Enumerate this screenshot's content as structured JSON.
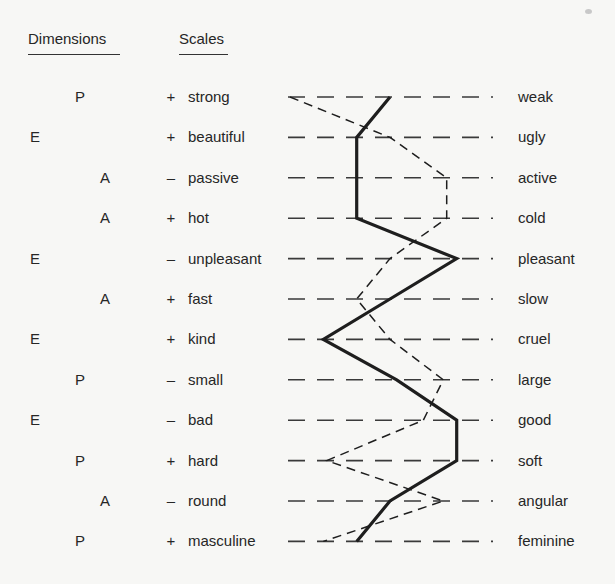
{
  "headers": {
    "dimensions": "Dimensions",
    "scales": "Scales"
  },
  "chart_data": {
    "type": "line",
    "title": "",
    "scale_points": 7,
    "xlim": [
      1,
      7
    ],
    "grid": "dashed horizontal line per scale",
    "rows": [
      {
        "dimension": "P",
        "sign": "+",
        "left": "strong",
        "right": "weak"
      },
      {
        "dimension": "E",
        "sign": "+",
        "left": "beautiful",
        "right": "ugly"
      },
      {
        "dimension": "A",
        "sign": "–",
        "left": "passive",
        "right": "active"
      },
      {
        "dimension": "A",
        "sign": "+",
        "left": "hot",
        "right": "cold"
      },
      {
        "dimension": "E",
        "sign": "–",
        "left": "unpleasant",
        "right": "pleasant"
      },
      {
        "dimension": "A",
        "sign": "+",
        "left": "fast",
        "right": "slow"
      },
      {
        "dimension": "E",
        "sign": "+",
        "left": "kind",
        "right": "cruel"
      },
      {
        "dimension": "P",
        "sign": "–",
        "left": "small",
        "right": "large"
      },
      {
        "dimension": "E",
        "sign": "–",
        "left": "bad",
        "right": "good"
      },
      {
        "dimension": "P",
        "sign": "+",
        "left": "hard",
        "right": "soft"
      },
      {
        "dimension": "A",
        "sign": "–",
        "left": "round",
        "right": "angular"
      },
      {
        "dimension": "P",
        "sign": "+",
        "left": "masculine",
        "right": "feminine"
      }
    ],
    "series": [
      {
        "name": "solid profile",
        "style": "solid",
        "values": [
          4,
          3,
          3,
          3,
          6,
          4,
          2,
          4.2,
          6,
          6,
          4,
          3
        ]
      },
      {
        "name": "dashed profile",
        "style": "dashed",
        "values": [
          1,
          4,
          5.7,
          5.7,
          4,
          3,
          4,
          5.6,
          5,
          2.1,
          5.6,
          2
        ]
      }
    ]
  },
  "colors": {
    "background": "#f7f7f5",
    "ink": "#1e1e1e",
    "grid": "#3a3a3a"
  }
}
